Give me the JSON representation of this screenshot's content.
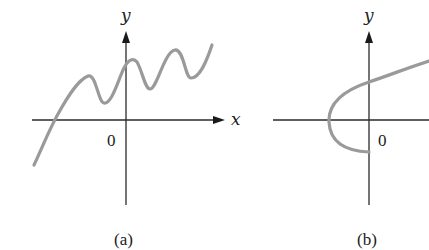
{
  "figure": {
    "panels": [
      {
        "id": "a",
        "caption": "(a)",
        "x_axis_label": "x",
        "y_axis_label": "y",
        "origin_label": "0",
        "curve_description": "wavy curve rising from lower left, oscillating upward"
      },
      {
        "id": "b",
        "caption": "(b)",
        "x_axis_label": "",
        "y_axis_label": "y",
        "origin_label": "0",
        "curve_description": "sideways parabola opening to the right, vertex left of origin"
      }
    ],
    "colors": {
      "axis": "#2a2a2a",
      "curve": "#9a9a9a",
      "background": "#ffffff"
    }
  }
}
